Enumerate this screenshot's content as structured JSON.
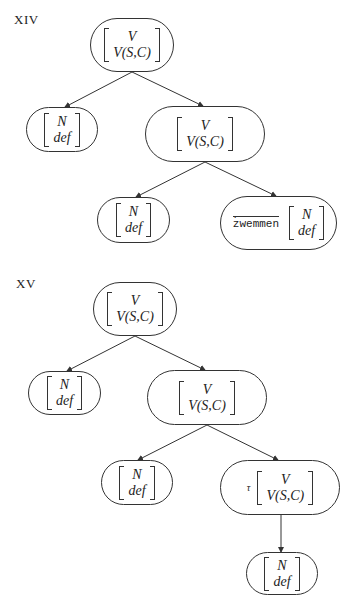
{
  "figures": [
    {
      "label": "XIV",
      "nodes": {
        "root": {
          "feat1": "V",
          "feat2": "V(S,C)"
        },
        "left": {
          "feat1": "N",
          "feat2": "def"
        },
        "mid": {
          "feat1": "V",
          "feat2": "V(S,C)"
        },
        "midleft": {
          "feat1": "N",
          "feat2": "def"
        },
        "midright": {
          "prefix": "zwemmen",
          "feat1": "N",
          "feat2": "def"
        }
      }
    },
    {
      "label": "XV",
      "nodes": {
        "root": {
          "feat1": "V",
          "feat2": "V(S,C)"
        },
        "left": {
          "feat1": "N",
          "feat2": "def"
        },
        "mid": {
          "feat1": "V",
          "feat2": "V(S,C)"
        },
        "midleft": {
          "feat1": "N",
          "feat2": "def"
        },
        "midright": {
          "prefix": "τ",
          "feat1": "V",
          "feat2": "V(S,C)"
        },
        "bottom": {
          "feat1": "N",
          "feat2": "def"
        }
      }
    }
  ],
  "colors": {
    "line": "#333333",
    "background": "#ffffff"
  }
}
